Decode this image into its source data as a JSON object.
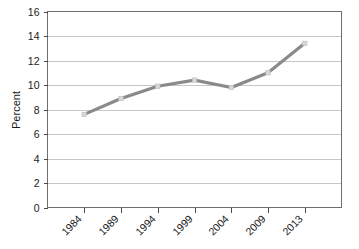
{
  "chart_data": {
    "type": "line",
    "title": "",
    "subtitle": "",
    "xlabel": "",
    "ylabel": "Percent",
    "categories": [
      "1984",
      "1989",
      "1994",
      "1999",
      "2004",
      "2009",
      "2013"
    ],
    "values": [
      7.6,
      8.9,
      9.9,
      10.4,
      9.8,
      11.0,
      13.4
    ],
    "series": [
      {
        "name": "Percent",
        "values": [
          7.6,
          8.9,
          9.9,
          10.4,
          9.8,
          11.0,
          13.4
        ],
        "color": "#8a8a8a"
      }
    ],
    "ylim": [
      0,
      16
    ],
    "yticks": [
      0,
      2,
      4,
      6,
      8,
      10,
      12,
      14,
      16
    ],
    "ytick_labels": [
      "0",
      "2",
      "4",
      "6",
      "8",
      "10",
      "12",
      "14",
      "16"
    ],
    "xtick_labels": [
      "1984",
      "1989",
      "1994",
      "1999",
      "2004",
      "2009",
      "2013"
    ],
    "xtick_rotation_deg": 45,
    "grid": {
      "horizontal": true,
      "vertical": false,
      "color": "#b9b9b9"
    },
    "legend": {
      "visible": false,
      "position": "none",
      "entries": []
    },
    "annotations": [],
    "markers": {
      "visible": true,
      "style": "square",
      "color": "#d8d8d8"
    },
    "colors": {
      "line": "#8a8a8a",
      "gridline": "#b9b9b9",
      "axis": "#6e6e6e",
      "text": "#1a1a1a",
      "background": "#ffffff"
    }
  }
}
